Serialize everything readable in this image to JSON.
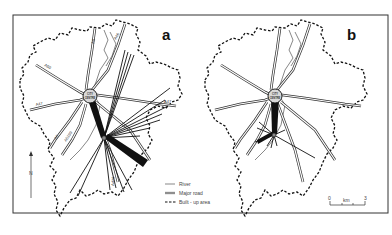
{
  "figure": {
    "panels": [
      {
        "id": "a",
        "letter": "a",
        "city_centre_label_line1": "CITY",
        "city_centre_label_line2": "CENTRE",
        "road_labels": [
          "A50",
          "A47",
          "A47",
          "A6",
          "A6",
          "A46",
          "A426",
          "A5199"
        ]
      },
      {
        "id": "b",
        "letter": "b",
        "city_centre_label_line1": "CITY",
        "city_centre_label_line2": "CENTRE"
      }
    ],
    "legend": {
      "items": [
        {
          "symbol": "river",
          "label": "River"
        },
        {
          "symbol": "major-road",
          "label": "Major road"
        },
        {
          "symbol": "built-up-area",
          "label": "Built - up area"
        }
      ]
    },
    "north_arrow": {
      "label": "N"
    },
    "scale_bar": {
      "start": "0",
      "unit": "km",
      "end": "3"
    },
    "colors": {
      "ink": "#111111",
      "road_fill": "#ffffff",
      "background": "#ffffff",
      "frame": "#333333"
    }
  }
}
